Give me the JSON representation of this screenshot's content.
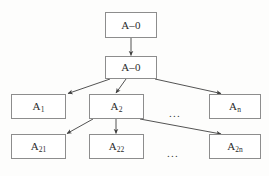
{
  "diagram": {
    "type": "hierarchical-tree",
    "title": "",
    "colors": {
      "background": "#fdfdfc",
      "box_fill": "#ffffff",
      "box_border": "#8d8d8d",
      "edge": "#4a4a4a",
      "text": "#2b2b2b"
    },
    "levels": [
      {
        "index": 0,
        "nodes": [
          {
            "id": "root",
            "label": "A–0",
            "base": "A–0",
            "sub": ""
          }
        ]
      },
      {
        "index": 1,
        "nodes": [
          {
            "id": "a0",
            "label": "A–0",
            "base": "A–0",
            "sub": ""
          }
        ]
      },
      {
        "index": 2,
        "nodes": [
          {
            "id": "a1",
            "label": "A1",
            "base": "A",
            "sub": "1"
          },
          {
            "id": "a2",
            "label": "A2",
            "base": "A",
            "sub": "2"
          },
          {
            "id": "an",
            "label": "An",
            "base": "A",
            "sub": "n"
          }
        ],
        "ellipsis": "..."
      },
      {
        "index": 3,
        "nodes": [
          {
            "id": "a21",
            "label": "A21",
            "base": "A",
            "sub": "21"
          },
          {
            "id": "a22",
            "label": "A22",
            "base": "A",
            "sub": "22"
          },
          {
            "id": "a2n",
            "label": "A2n",
            "base": "A",
            "sub": "2n"
          }
        ],
        "ellipsis": "..."
      }
    ]
  }
}
